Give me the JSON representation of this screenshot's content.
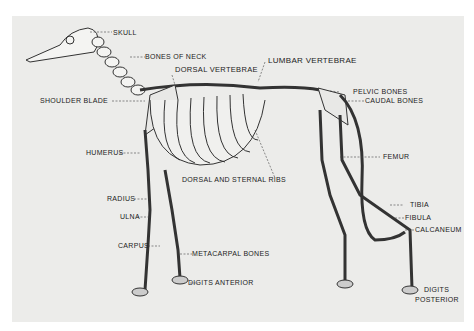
{
  "diagram": {
    "labels": {
      "skull": "SKULL",
      "bones_of_neck": "BONES OF NECK",
      "dorsal_vertebrae": "DORSAL VERTEBRAE",
      "lumbar_vertebrae": "LUMBAR VERTEBRAE",
      "shoulder_blade": "SHOULDER BLADE",
      "pelvic_bones": "PELVIC BONES",
      "caudal_bones": "CAUDAL BONES",
      "humerus": "HUMERUS",
      "femur": "FEMUR",
      "dorsal_and_sternal_ribs": "DORSAL AND STERNAL RIBS",
      "radius": "RADIUS",
      "ulna": "ULNA",
      "tibia": "TIBIA",
      "fibula": "FIBULA",
      "calcaneum": "CALCANEUM",
      "carpus": "CARPUS",
      "metacarpal_bones": "METACARPAL BONES",
      "digits_anterior": "DIGITS ANTERIOR",
      "digits": "DIGITS",
      "posterior": "POSTERIOR"
    }
  }
}
